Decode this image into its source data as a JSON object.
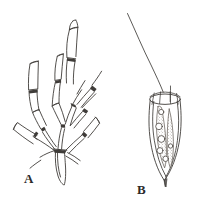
{
  "figure": {
    "kind": "scientific-line-drawing",
    "background_color": "#ffffff",
    "ink_color": "#3a3a3a",
    "panels": [
      {
        "id": "A",
        "label": "A",
        "label_x": 24,
        "label_y": 172,
        "caption_text": "A",
        "subject": "branching colonial tubular organism",
        "description": "Colony of elongated tubular cells (zooids) arising from a single tapered basal stalk; cells joined at dark septal nodes and diverging upward and outward.",
        "element_names": [
          "basal-stalk",
          "septal-node",
          "tubular-zooid",
          "branch-left",
          "branch-upper",
          "branch-right-fan"
        ],
        "zooid_count": 12,
        "node_count": 9
      },
      {
        "id": "B",
        "label": "B",
        "label_x": 137,
        "label_y": 183,
        "caption_text": "B",
        "subject": "single flagellated cell in lorica",
        "description": "Solitary choanoflagellate-like cell: long curved flagellum from apex, ringed collar of microvilli at the open top, vase-shaped lorica enclosing stippled cytoplasm with several round vacuoles, tapering to a pointed basal tip.",
        "element_names": [
          "flagellum",
          "collar-ring",
          "collar-microvillus",
          "lorica-outline",
          "cell-body-outline",
          "cytoplasm-stipple",
          "vacuole",
          "basal-tip"
        ],
        "vacuole_count": 6
      }
    ],
    "panel_a": {
      "label": "A"
    },
    "panel_b": {
      "label": "B"
    }
  },
  "icons": {
    "flagellum": "flagellum-icon",
    "collar": "collar-ring-icon",
    "vacuole": "vacuole-icon",
    "node": "septal-node-icon"
  }
}
